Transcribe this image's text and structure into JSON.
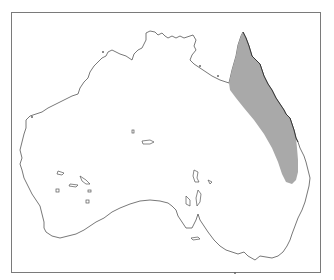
{
  "map": {
    "region": "Australia",
    "type": "distribution-range-map",
    "range": {
      "label": "",
      "fill": "#a9a9a9",
      "area": "north-eastern Queensland, Cape York to central Queensland coast"
    },
    "colors": {
      "background": "#ffffff",
      "coastline": "#555555",
      "frame": "#7a7a7a",
      "range_fill": "#a9a9a9"
    }
  }
}
